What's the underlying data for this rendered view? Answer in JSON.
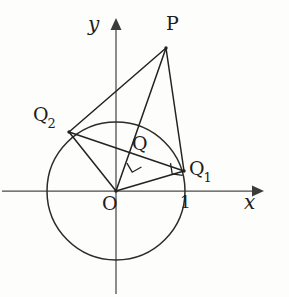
{
  "figure": {
    "kind": "geometry-diagram",
    "width": 289,
    "height": 297,
    "background_color": "#fdfdfb",
    "ink_color": "#222220",
    "axis_color": "#4a4a46"
  },
  "axes": {
    "x_label": "x",
    "y_label": "y",
    "origin_label": "O",
    "x_tick_label": "1",
    "origin_px": {
      "x": 116,
      "y": 191
    },
    "x_axis": {
      "x1": 2,
      "y1": 191,
      "x2": 262,
      "y2": 191
    },
    "y_axis": {
      "x1": 116,
      "y1": 294,
      "x2": 116,
      "y2": 20
    }
  },
  "circle": {
    "center_px": {
      "x": 116,
      "y": 191
    },
    "radius_px": 69,
    "radius_units": 1
  },
  "points": [
    {
      "name": "P",
      "label": "P",
      "sub": "",
      "px": {
        "x": 166,
        "y": 48
      },
      "label_px": {
        "x": 168,
        "y": 20
      }
    },
    {
      "name": "Q2",
      "label": "Q",
      "sub": "2",
      "px": {
        "x": 69,
        "y": 132
      },
      "label_px": {
        "x": 34,
        "y": 110
      }
    },
    {
      "name": "Q1",
      "label": "Q",
      "sub": "1",
      "px": {
        "x": 184,
        "y": 171
      },
      "label_px": {
        "x": 190,
        "y": 160
      }
    },
    {
      "name": "Q",
      "label": "Q",
      "sub": "",
      "px": {
        "x": 142,
        "y": 160
      },
      "label_px": {
        "x": 133,
        "y": 137
      }
    },
    {
      "name": "O",
      "label": "O",
      "sub": "",
      "px": {
        "x": 116,
        "y": 191
      },
      "label_px": {
        "x": 104,
        "y": 196
      }
    }
  ],
  "segments": [
    {
      "name": "P-Q2",
      "from": "P",
      "to": "Q2"
    },
    {
      "name": "P-Q1",
      "from": "P",
      "to": "Q1"
    },
    {
      "name": "P-O",
      "from": "P",
      "to": "O"
    },
    {
      "name": "O-Q1",
      "from": "O",
      "to": "Q1"
    },
    {
      "name": "O-Q2",
      "from": "O",
      "to": "Q2"
    },
    {
      "name": "Q2-Q1",
      "from": "Q2",
      "to": "Q1"
    }
  ],
  "right_angles": [
    {
      "name": "right-angle-at-Q",
      "at": "Q",
      "note": "PO perpendicular to chord Q2Q1"
    },
    {
      "name": "right-angle-at-Q1",
      "at": "Q1",
      "note": "OQ1 perpendicular to PQ1"
    }
  ],
  "tick_label_px": {
    "x": 182,
    "y": 196
  },
  "x_label_px": {
    "y": 196,
    "x": 244
  },
  "y_label_px": {
    "x": 90,
    "y": 16
  }
}
